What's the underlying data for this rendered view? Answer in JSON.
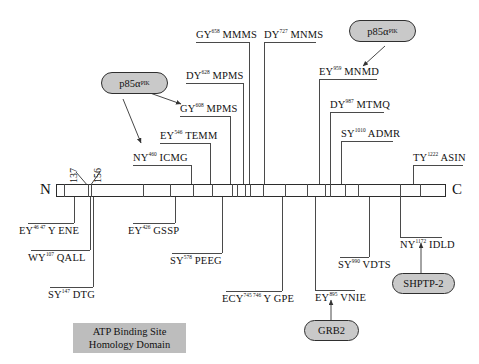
{
  "figure": {
    "n_terminus": "N",
    "c_terminus": "C",
    "domain_box": {
      "line1": "ATP Binding Site",
      "line2": "Homology Domain"
    }
  },
  "colors": {
    "backbone_stroke": "#2b2b2b",
    "leader_line": "#4a4a4a",
    "oval_fill": "#c9c9c9",
    "oval_stroke": "#2f2f2f",
    "domain_box_fill": "#bdbdbd",
    "text": "#111111",
    "page_background": "#ffffff"
  },
  "backbone_markers": [
    {
      "number": "137"
    },
    {
      "number": "156"
    }
  ],
  "sites_above": [
    {
      "pre": "NY",
      "sup": "460",
      "post": "ICMG"
    },
    {
      "pre": "EY",
      "sup": "546",
      "post": "TEMM"
    },
    {
      "pre": "GY",
      "sup": "608",
      "post": "MPMS"
    },
    {
      "pre": "DY",
      "sup": "628",
      "post": "MPMS"
    },
    {
      "pre": "GY",
      "sup": "658",
      "post": "MMMS"
    },
    {
      "pre": "DY",
      "sup": "727",
      "post": "MNMS"
    },
    {
      "pre": "EY",
      "sup": "959",
      "post": "MNMD"
    },
    {
      "pre": "DY",
      "sup": "987",
      "post": "MTMQ"
    },
    {
      "pre": "SY",
      "sup": "1010",
      "post": "ADMR"
    },
    {
      "pre": "TY",
      "sup": "1222",
      "post": "ASIN"
    }
  ],
  "sites_below": [
    {
      "pre": "EY",
      "sup": "46 47",
      "post": "Y ENE"
    },
    {
      "pre": "WY",
      "sup": "107",
      "post": "QALL"
    },
    {
      "pre": "SY",
      "sup": "147",
      "post": "DTG"
    },
    {
      "pre": "EY",
      "sup": "426",
      "post": "GSSP"
    },
    {
      "pre": "SY",
      "sup": "578",
      "post": "PEEG"
    },
    {
      "pre": "ECY",
      "sup": "745 746",
      "post": "Y GPE"
    },
    {
      "pre": "EY",
      "sup": "895",
      "post": "VNIE"
    },
    {
      "pre": "SY",
      "sup": "990",
      "post": "VDTS"
    },
    {
      "pre": "NY",
      "sup": "1172",
      "post": "IDLD"
    }
  ],
  "binding_partners": [
    {
      "id": "p85a-left",
      "base": "p85α",
      "sup": "PIK"
    },
    {
      "id": "p85a-right",
      "base": "p85α",
      "sup": "PIK"
    },
    {
      "id": "grb2",
      "base": "GRB2",
      "sup": ""
    },
    {
      "id": "shptp2",
      "base": "SHPTP-2",
      "sup": ""
    }
  ]
}
